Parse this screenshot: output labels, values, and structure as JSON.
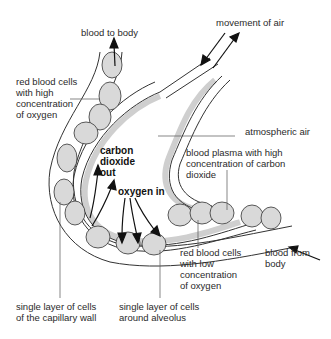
{
  "diagram": {
    "title": "",
    "labels": {
      "blood_to_body": "blood to body",
      "movement_of_air": "movement of air",
      "rbc_high": [
        "red blood cells",
        "with high",
        "concentration",
        "of oxygen"
      ],
      "atmospheric_air": "atmospheric air",
      "carbon_dioxide_out": [
        "carbon",
        "dioxide",
        "out"
      ],
      "blood_plasma": [
        "blood plasma with high",
        "concentration of carbon",
        "dioxide"
      ],
      "oxygen_in": "oxygen in",
      "rbc_low": [
        "red blood cells",
        "with low",
        "concentration",
        "of oxygen"
      ],
      "blood_from_body": [
        "blood from",
        "body"
      ],
      "capillary_wall": [
        "single layer of cells",
        "of the capillary wall"
      ],
      "alveolus_layer": [
        "single layer of cells",
        "around alveolus"
      ]
    },
    "colors": {
      "line": "#333333",
      "cell_fill": "#d9d9d9",
      "alveolus_lining": "#cfcfcf"
    }
  }
}
